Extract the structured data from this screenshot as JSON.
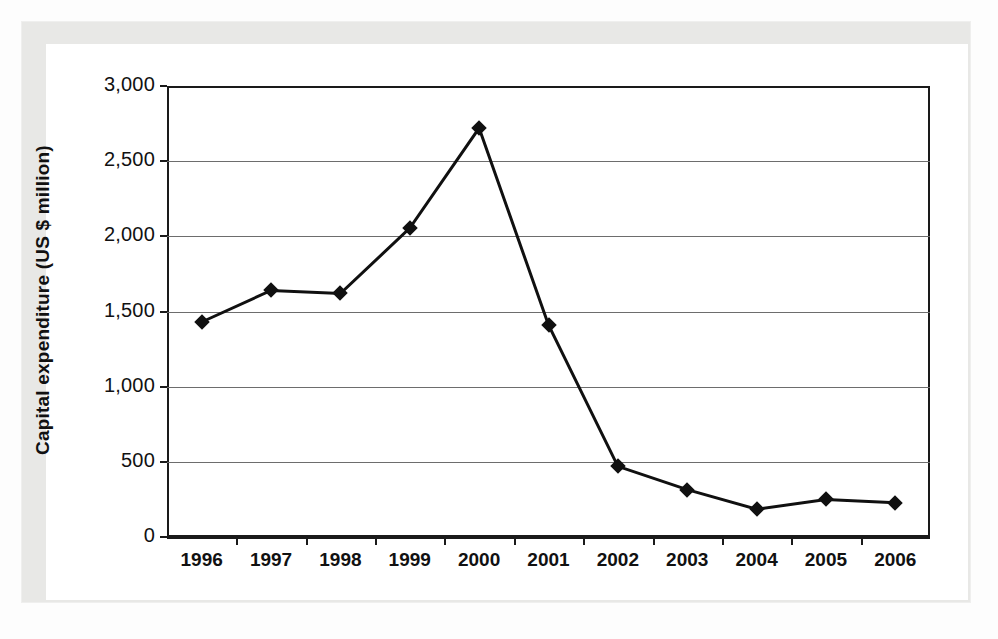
{
  "figure": {
    "background_color": "#ffffff",
    "frame_color": "#e8e8e6",
    "axis_color": "#1a1a1a",
    "gridline_color": "#6d6d6d",
    "series_color": "#101010"
  },
  "chart_data": {
    "type": "line",
    "title": "",
    "xlabel": "",
    "ylabel": "Capital expenditure (US $ million)",
    "categories": [
      "1996",
      "1997",
      "1998",
      "1999",
      "2000",
      "2001",
      "2002",
      "2003",
      "2004",
      "2005",
      "2006"
    ],
    "values": [
      1430,
      1640,
      1620,
      2055,
      2720,
      1410,
      470,
      315,
      185,
      250,
      228
    ],
    "series": [
      {
        "name": "Capital expenditure",
        "values": [
          1430,
          1640,
          1620,
          2055,
          2720,
          1410,
          470,
          315,
          185,
          250,
          228
        ]
      }
    ],
    "ylim": [
      0,
      3000
    ],
    "yticks": [
      0,
      500,
      1000,
      1500,
      2000,
      2500,
      3000
    ],
    "ytick_labels": [
      "0",
      "500",
      "1,000",
      "1,500",
      "2,000",
      "2,500",
      "3,000"
    ],
    "grid": true,
    "grid_axis": "y",
    "legend": false,
    "legend_position": "none",
    "marker": "diamond",
    "line_width": 3
  }
}
